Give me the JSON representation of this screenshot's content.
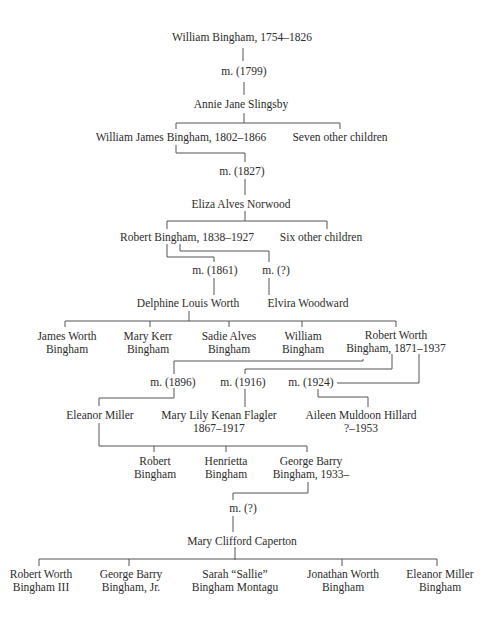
{
  "family_tree": {
    "nodes": [
      {
        "id": "wb",
        "text": "William Bingham, 1754–1826",
        "x": 242,
        "y": 31
      },
      {
        "id": "m1799",
        "text": "m. (1799)",
        "x": 244,
        "y": 65
      },
      {
        "id": "ajs",
        "text": "Annie Jane Slingsby",
        "x": 241,
        "y": 98
      },
      {
        "id": "wjb",
        "text": "William James Bingham, 1802–1866",
        "x": 181,
        "y": 131
      },
      {
        "id": "seven",
        "text": "Seven other children",
        "x": 340,
        "y": 131
      },
      {
        "id": "m1827",
        "text": "m. (1827)",
        "x": 242,
        "y": 165
      },
      {
        "id": "ean",
        "text": "Eliza Alves Norwood",
        "x": 241,
        "y": 198
      },
      {
        "id": "rb",
        "text": "Robert Bingham, 1838–1927",
        "x": 187,
        "y": 231
      },
      {
        "id": "six",
        "text": "Six other children",
        "x": 321,
        "y": 231
      },
      {
        "id": "m1861",
        "text": "m. (1861)",
        "x": 215,
        "y": 264
      },
      {
        "id": "mq1",
        "text": "m. (?)",
        "x": 276,
        "y": 264
      },
      {
        "id": "dlw",
        "text": "Delphine Louis Worth",
        "x": 188,
        "y": 297
      },
      {
        "id": "ew",
        "text": "Elvira Woodward",
        "x": 308,
        "y": 297
      },
      {
        "id": "jwb",
        "text": "James Worth\nBingham",
        "x": 67,
        "y": 330
      },
      {
        "id": "mkb",
        "text": "Mary Kerr\nBingham",
        "x": 148,
        "y": 330
      },
      {
        "id": "sab",
        "text": "Sadie Alves\nBingham",
        "x": 229,
        "y": 330
      },
      {
        "id": "wb2",
        "text": "William\nBingham",
        "x": 303,
        "y": 330
      },
      {
        "id": "rwb",
        "text": "Robert Worth\nBingham, 1871–1937",
        "x": 396,
        "y": 329
      },
      {
        "id": "m1896",
        "text": "m. (1896)",
        "x": 173,
        "y": 376
      },
      {
        "id": "m1916",
        "text": "m. (1916)",
        "x": 243,
        "y": 376
      },
      {
        "id": "m1924",
        "text": "m. (1924)",
        "x": 311,
        "y": 376
      },
      {
        "id": "em",
        "text": "Eleanor Miller",
        "x": 100,
        "y": 409
      },
      {
        "id": "mlkf",
        "text": "Mary Lily Kenan Flagler\n1867–1917",
        "x": 219,
        "y": 409
      },
      {
        "id": "amh",
        "text": "Aileen Muldoon Hillard\n?–1953",
        "x": 361,
        "y": 409
      },
      {
        "id": "rob",
        "text": "Robert\nBingham",
        "x": 155,
        "y": 455
      },
      {
        "id": "hen",
        "text": "Henrietta\nBingham",
        "x": 226,
        "y": 455
      },
      {
        "id": "gbb",
        "text": "George Barry\nBingham, 1933–",
        "x": 311,
        "y": 455
      },
      {
        "id": "mq2",
        "text": "m. (?)",
        "x": 243,
        "y": 502
      },
      {
        "id": "mcc",
        "text": "Mary Clifford Caperton",
        "x": 242,
        "y": 535
      },
      {
        "id": "rwb3",
        "text": "Robert Worth\nBingham III",
        "x": 41,
        "y": 568
      },
      {
        "id": "gbbjr",
        "text": "George Barry\nBingham, Jr.",
        "x": 131,
        "y": 568
      },
      {
        "id": "ssbm",
        "text": "Sarah “Sallie”\nBingham Montagu",
        "x": 235,
        "y": 568
      },
      {
        "id": "jwb2",
        "text": "Jonathan Worth\nBingham",
        "x": 343,
        "y": 568
      },
      {
        "id": "emb",
        "text": "Eleanor Miller\nBingham",
        "x": 440,
        "y": 568
      }
    ],
    "line_color": "#555555",
    "text_color": "#2b2b2b"
  }
}
